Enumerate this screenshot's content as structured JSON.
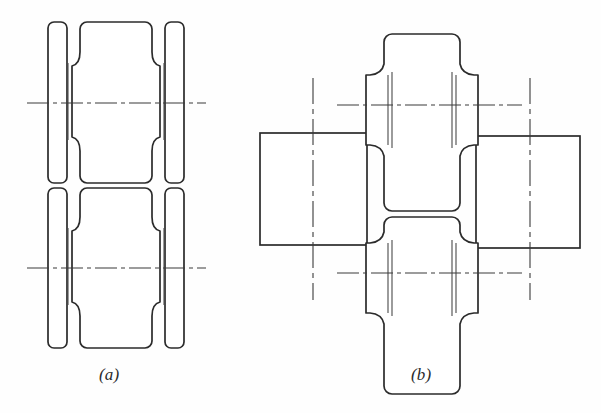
{
  "figure": {
    "background_color": "#fefefe",
    "line_color": "#2b2b2b",
    "centerline_color": "#3a3a3a",
    "stroke_width": 1.6,
    "subfigures": [
      {
        "id": "a",
        "label": "(a)",
        "caption_x": 99,
        "caption_y": 365
      },
      {
        "id": "b",
        "label": "(b)",
        "caption_x": 411,
        "caption_y": 365
      }
    ]
  },
  "view_a": {
    "name": "front-elevation",
    "rolls": [
      {
        "id": "upper-roll-a",
        "centerline_y": 103,
        "top": 22,
        "bottom": 183
      },
      {
        "id": "lower-roll-a",
        "centerline_y": 268,
        "top": 188,
        "bottom": 348
      }
    ],
    "geometry": {
      "left_flange_x": [
        48,
        67
      ],
      "left_groove_x": [
        67,
        80
      ],
      "barrel_x": [
        80,
        152
      ],
      "right_groove_x": [
        152,
        165
      ],
      "right_flange_x": [
        165,
        184
      ],
      "corner_radius": 6
    },
    "centerlines": [
      {
        "id": "centerline-upper-a",
        "y": 103,
        "x1": 27,
        "x2": 206
      },
      {
        "id": "centerline-lower-a",
        "y": 268,
        "x1": 27,
        "x2": 206
      }
    ]
  },
  "view_b": {
    "name": "side-elevation",
    "rolls": [
      {
        "id": "upper-roll-b",
        "centerline_y": 105,
        "top": 34,
        "bottom": 211
      },
      {
        "id": "lower-roll-b",
        "centerline_y": 273,
        "top": 217,
        "bottom": 394
      }
    ],
    "geometry": {
      "top_flange_y": [
        34,
        64
      ],
      "barrel_y_span": 72,
      "flange_outer_x": [
        366,
        478
      ],
      "barrel_outer_x": [
        385,
        459
      ],
      "corner_radius": 8
    },
    "workpiece_rectangles": [
      {
        "id": "left-workpiece",
        "x": 260,
        "y": 133,
        "width": 107,
        "height": 112
      },
      {
        "id": "right-workpiece",
        "x": 476,
        "y": 136,
        "width": 104,
        "height": 112
      }
    ],
    "centerlines": [
      {
        "id": "centerline-horizontal-upper-b",
        "orientation": "horizontal",
        "y": 105,
        "x1": 337,
        "x2": 522
      },
      {
        "id": "centerline-horizontal-lower-b",
        "orientation": "horizontal",
        "y": 273,
        "x1": 337,
        "x2": 522
      },
      {
        "id": "centerline-vertical-left-b",
        "orientation": "vertical",
        "x": 313,
        "y1": 78,
        "y2": 300
      },
      {
        "id": "centerline-vertical-right-b",
        "orientation": "vertical",
        "x": 530,
        "y1": 78,
        "y2": 300
      }
    ]
  }
}
